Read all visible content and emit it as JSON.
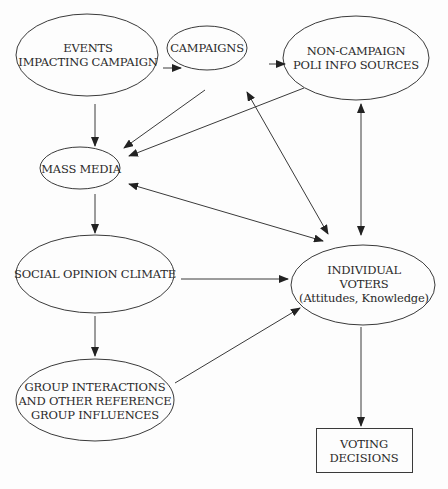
{
  "diagram": {
    "type": "flow",
    "nodes": [
      {
        "id": "events",
        "lines": [
          "EVENTS",
          "IMPACTING CAMPAIGN"
        ],
        "shape": "ellipse"
      },
      {
        "id": "campaigns",
        "lines": [
          "CAMPAIGNS"
        ],
        "shape": "ellipse"
      },
      {
        "id": "noncampaign",
        "lines": [
          "NON-CAMPAIGN",
          "POLI INFO SOURCES"
        ],
        "shape": "ellipse"
      },
      {
        "id": "massmedia",
        "lines": [
          "MASS MEDIA"
        ],
        "shape": "ellipse"
      },
      {
        "id": "social",
        "lines": [
          "SOCIAL OPINION CLIMATE"
        ],
        "shape": "ellipse"
      },
      {
        "id": "voters",
        "lines": [
          "INDIVIDUAL",
          "VOTERS",
          "(Attitudes, Knowledge)"
        ],
        "shape": "ellipse"
      },
      {
        "id": "group",
        "lines": [
          "GROUP INTERACTIONS",
          "AND OTHER REFERENCE",
          "GROUP INFLUENCES"
        ],
        "shape": "ellipse"
      },
      {
        "id": "decisions",
        "lines": [
          "VOTING",
          "DECISIONS"
        ],
        "shape": "rectangle"
      }
    ],
    "edges": [
      {
        "from": "events",
        "to": "campaigns",
        "direction": "forward"
      },
      {
        "from": "campaigns",
        "to": "noncampaign",
        "direction": "forward"
      },
      {
        "from": "events",
        "to": "massmedia",
        "direction": "forward"
      },
      {
        "from": "campaigns",
        "to": "massmedia",
        "direction": "forward"
      },
      {
        "from": "noncampaign",
        "to": "massmedia",
        "direction": "forward"
      },
      {
        "from": "campaigns",
        "to": "voters",
        "direction": "both"
      },
      {
        "from": "noncampaign",
        "to": "voters",
        "direction": "both"
      },
      {
        "from": "massmedia",
        "to": "voters",
        "direction": "both"
      },
      {
        "from": "massmedia",
        "to": "social",
        "direction": "forward"
      },
      {
        "from": "social",
        "to": "voters",
        "direction": "forward"
      },
      {
        "from": "social",
        "to": "group",
        "direction": "forward"
      },
      {
        "from": "group",
        "to": "voters",
        "direction": "forward"
      },
      {
        "from": "voters",
        "to": "decisions",
        "direction": "forward"
      }
    ],
    "colors": {
      "stroke": "#3a3a3a",
      "text": "#2a2a2a",
      "background": "#fdfdfd"
    }
  }
}
